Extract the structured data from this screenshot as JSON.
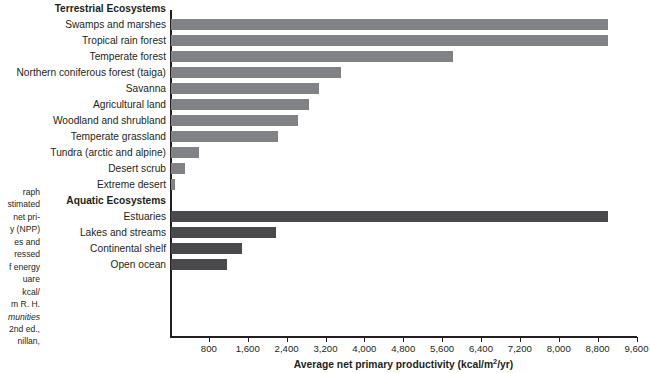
{
  "chart_data": {
    "type": "bar",
    "orientation": "horizontal",
    "title": "",
    "xlabel": "Average net primary productivity (kcal/m2/yr)",
    "xlabel_html": "Average net primary productivity (kcal/m<sup>2</sup>/yr)",
    "ylabel": "",
    "xlim": [
      0,
      9600
    ],
    "xticks": [
      800,
      1600,
      2400,
      3200,
      4000,
      4800,
      5600,
      6400,
      7200,
      8000,
      8800,
      9600
    ],
    "xticklabels": [
      "800",
      "1,600",
      "2,400",
      "3,200",
      "4,000",
      "4,800",
      "5,600",
      "6,400",
      "7,200",
      "8,000",
      "8,800",
      "9,600"
    ],
    "grid": false,
    "legend": "none",
    "groups": [
      {
        "name": "Terrestrial Ecosystems",
        "color": "#808285",
        "series_key": "terrestrial",
        "categories": [
          "Swamps and marshes",
          "Tropical rain forest",
          "Temperate forest",
          "Northern coniferous forest (taiga)",
          "Savanna",
          "Agricultural land",
          "Woodland and shrubland",
          "Temperate grassland",
          "Tundra (arctic and alpine)",
          "Desert scrub",
          "Extreme desert"
        ],
        "values": [
          9000,
          9000,
          5800,
          3500,
          3050,
          2850,
          2620,
          2200,
          580,
          290,
          90
        ]
      },
      {
        "name": "Aquatic Ecosystems",
        "color": "#4a4a4c",
        "series_key": "aquatic",
        "categories": [
          "Estuaries",
          "Lakes and streams",
          "Continental shelf",
          "Open ocean"
        ],
        "values": [
          9000,
          2170,
          1470,
          1150
        ]
      }
    ]
  },
  "caption": {
    "lines": [
      {
        "text": "raph",
        "italic": false
      },
      {
        "text": "stimated",
        "italic": false
      },
      {
        "text": "net pri-",
        "italic": false
      },
      {
        "text": "y (NPP)",
        "italic": false
      },
      {
        "text": "es and",
        "italic": false
      },
      {
        "text": "ressed",
        "italic": false
      },
      {
        "text": "f energy",
        "italic": false
      },
      {
        "text": "uare",
        "italic": false
      },
      {
        "text": "kcal/",
        "italic": false
      },
      {
        "text": "m R. H.",
        "italic": false
      },
      {
        "text": "munities",
        "italic": true
      },
      {
        "text": "2nd ed.,",
        "italic": false
      },
      {
        "text": "nillan,",
        "italic": false
      }
    ]
  },
  "colors": {
    "terrestrial_bar": "#808285",
    "aquatic_bar": "#4a4a4c",
    "axis": "#231f20",
    "text": "#231f20",
    "background": "#ffffff"
  }
}
